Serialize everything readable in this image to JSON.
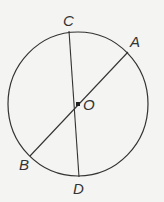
{
  "diagram": {
    "type": "circle-with-diameters",
    "circle": {
      "center_label": "O",
      "cx": 78,
      "cy": 104,
      "rx": 70,
      "ry": 72
    },
    "points": [
      {
        "label": "C",
        "x": 69,
        "y": 31,
        "lx": 63,
        "ly": 26
      },
      {
        "label": "A",
        "x": 128,
        "y": 52,
        "lx": 130,
        "ly": 47
      },
      {
        "label": "O",
        "x": 78,
        "y": 104,
        "lx": 83,
        "ly": 110
      },
      {
        "label": "B",
        "x": 30,
        "y": 156,
        "lx": 19,
        "ly": 170
      },
      {
        "label": "D",
        "x": 79,
        "y": 177,
        "lx": 73,
        "ly": 194
      }
    ],
    "segments": [
      {
        "from": "C",
        "to": "D"
      },
      {
        "from": "A",
        "to": "B"
      }
    ],
    "colors": {
      "stroke": "#333333",
      "background": "#f4f4f2"
    }
  }
}
